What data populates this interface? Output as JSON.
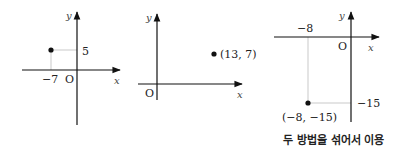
{
  "graphs": [
    {
      "axis_labels": {
        "x": "x",
        "y": "y",
        "origin": "O"
      },
      "point": {
        "x": -7,
        "y": 5
      },
      "tick_labels": {
        "x": "−7",
        "y": "5"
      }
    },
    {
      "axis_labels": {
        "x": "x",
        "y": "y",
        "origin": "O"
      },
      "point": {
        "x": 13,
        "y": 7
      },
      "point_label": "(13, 7)"
    },
    {
      "axis_labels": {
        "x": "x",
        "y": "y",
        "origin": "O"
      },
      "point": {
        "x": -8,
        "y": -15
      },
      "tick_labels": {
        "x": "−8",
        "y": "−15"
      },
      "point_label": "(−8, −15)",
      "caption": "두 방법을 섞어서 이용"
    }
  ],
  "colors": {
    "axis": "#111111",
    "guide": "#bbbbbb",
    "point": "#111111"
  }
}
